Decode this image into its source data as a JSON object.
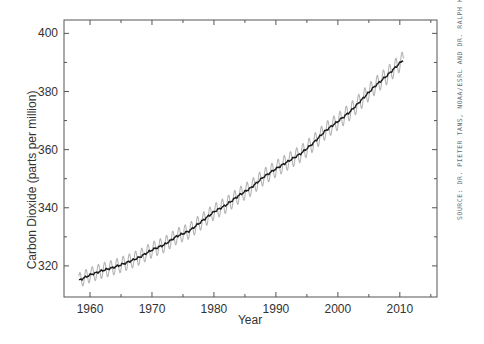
{
  "chart_data": {
    "type": "line",
    "title": "",
    "xlabel": "Year",
    "ylabel": "Carbon Dioxide (parts per million)",
    "xlim": [
      1955.8,
      2016
    ],
    "ylim": [
      309.3,
      404.6
    ],
    "x_ticks": [
      1960,
      1970,
      1980,
      1990,
      2000,
      2010
    ],
    "y_ticks": [
      320,
      340,
      360,
      380,
      400
    ],
    "grid": false,
    "legend": null,
    "series": [
      {
        "name": "Monthly mean (seasonal)",
        "style": "light gray, oscillating",
        "color": "#b4b4b4",
        "seasonal_amplitude_ppm": 3.0
      },
      {
        "name": "Seasonally corrected trend",
        "style": "dark solid line",
        "color": "#1a1a1a"
      }
    ],
    "x": [
      1958.2,
      1960,
      1962,
      1964,
      1966,
      1968,
      1970,
      1972,
      1974,
      1976,
      1978,
      1980,
      1982,
      1984,
      1986,
      1988,
      1990,
      1992,
      1994,
      1996,
      1998,
      2000,
      2002,
      2004,
      2006,
      2008,
      2010,
      2010.6
    ],
    "trend_values": [
      315.0,
      316.9,
      318.4,
      319.6,
      321.2,
      323.0,
      325.5,
      327.3,
      330.2,
      332.0,
      335.3,
      338.6,
      341.0,
      344.2,
      346.9,
      350.6,
      353.4,
      356.0,
      358.6,
      362.2,
      366.5,
      369.7,
      373.1,
      377.5,
      381.9,
      385.6,
      389.8,
      391.0
    ]
  },
  "source_note": "SOURCE: DR. PIETER TANS, NOAA/ESRL AND DR. RALPH KEELING."
}
